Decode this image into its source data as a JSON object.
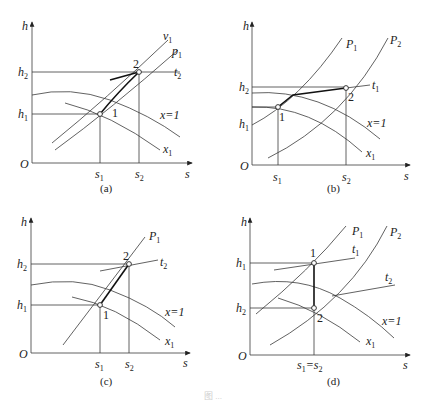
{
  "figure": {
    "caption_faint": "图 ...",
    "panels": [
      {
        "id": "a",
        "label": "(a)",
        "y_axis": "h",
        "x_axis": "s",
        "origin": "O",
        "h_ticks": [
          "h2",
          "h1"
        ],
        "s_ticks": [
          "s1",
          "s2"
        ],
        "curves": [
          "v1",
          "p1",
          "t2",
          "x=1",
          "x1"
        ],
        "points": [
          "1",
          "2"
        ]
      },
      {
        "id": "b",
        "label": "(b)",
        "y_axis": "h",
        "x_axis": "s",
        "origin": "O",
        "h_ticks": [
          "h2",
          "h1"
        ],
        "s_ticks": [
          "s1",
          "s2"
        ],
        "curves": [
          "P1",
          "P2",
          "t1",
          "x=1",
          "x1"
        ],
        "points": [
          "1",
          "2"
        ]
      },
      {
        "id": "c",
        "label": "(c)",
        "y_axis": "h",
        "x_axis": "s",
        "origin": "O",
        "h_ticks": [
          "h2",
          "h1"
        ],
        "s_ticks": [
          "s1",
          "s2"
        ],
        "curves": [
          "P1",
          "t2",
          "x=1",
          "x1"
        ],
        "points": [
          "1",
          "2"
        ]
      },
      {
        "id": "d",
        "label": "(d)",
        "y_axis": "h",
        "x_axis": "s",
        "origin": "O",
        "h_ticks": [
          "h1",
          "h2"
        ],
        "s_ticks": [
          "s1=s2"
        ],
        "curves": [
          "P1",
          "P2",
          "t1",
          "t2",
          "x=1",
          "x1"
        ],
        "points": [
          "1",
          "2"
        ]
      }
    ]
  },
  "labels": {
    "h": "h",
    "s": "s",
    "O": "O",
    "h1": "h",
    "h2": "h",
    "s1": "s",
    "s2": "s",
    "one": "1",
    "two": "2",
    "x_eq_1": "x=1",
    "a": "(a)",
    "b": "(b)",
    "c": "(c)",
    "d": "(d)"
  }
}
